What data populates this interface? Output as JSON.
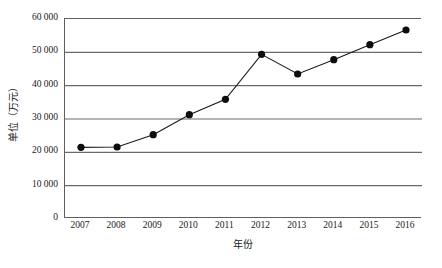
{
  "chart_data": {
    "type": "line",
    "title": "",
    "subtitle": "",
    "xlabel": "年份",
    "ylabel": "单位（万元）",
    "categories": [
      "2007",
      "2008",
      "2009",
      "2010",
      "2011",
      "2012",
      "2013",
      "2014",
      "2015",
      "2016"
    ],
    "x": [
      2007,
      2008,
      2009,
      2010,
      2011,
      2012,
      2013,
      2014,
      2015,
      2016
    ],
    "values": [
      21500,
      21600,
      25300,
      31300,
      35900,
      49400,
      43500,
      47800,
      52300,
      56700
    ],
    "series": [
      {
        "name": "",
        "values": [
          21500,
          21600,
          25300,
          31300,
          35900,
          49400,
          43500,
          47800,
          52300,
          56700
        ]
      }
    ],
    "ylim": [
      0,
      60000
    ],
    "ytick_values": [
      0,
      10000,
      20000,
      30000,
      40000,
      50000,
      60000
    ],
    "ytick_labels": [
      "0",
      "10 000",
      "20 000",
      "30 000",
      "40 000",
      "50 000",
      "60 000"
    ],
    "grid": "horizontal",
    "legend": "none",
    "marker": "filled-circle",
    "marker_color": "#0d0d0d",
    "line_color": "#1a1a1a",
    "grid_color": "#6b6b6b",
    "axis_color": "#5f5f5f",
    "background_color": "#ffffff"
  }
}
